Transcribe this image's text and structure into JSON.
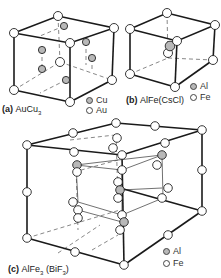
{
  "figures": [
    {
      "id": "a",
      "label_prefix": "(a)",
      "formula": "AuCu",
      "formula_sub": "3",
      "legend": [
        {
          "symbol": "shaded-circle",
          "label": "Cu",
          "color": "#b8b8b8"
        },
        {
          "symbol": "open-circle",
          "label": "Au",
          "color": "#ffffff"
        }
      ]
    },
    {
      "id": "b",
      "label_prefix": "(b)",
      "formula": "AlFe(CsCl)",
      "legend": [
        {
          "symbol": "shaded-circle",
          "label": "Al",
          "color": "#b8b8b8"
        },
        {
          "symbol": "open-circle",
          "label": "Fe",
          "color": "#ffffff"
        }
      ]
    },
    {
      "id": "c",
      "label_prefix": "(c)",
      "formula": "AlFe",
      "formula_sub": "3",
      "formula_extra": "(BiF",
      "formula_extra_sub": "3",
      "formula_extra_close": ")",
      "legend": [
        {
          "symbol": "shaded-circle",
          "label": "Al",
          "color": "#b8b8b8"
        },
        {
          "symbol": "open-circle",
          "label": "Fe",
          "color": "#ffffff"
        }
      ]
    }
  ],
  "colors": {
    "line": "#1a1a1a",
    "shaded_atom": "#b8b8b8",
    "open_atom": "#ffffff",
    "background": "#ffffff"
  }
}
